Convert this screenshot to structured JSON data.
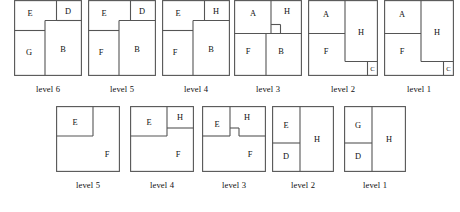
{
  "figure": {
    "name": "floorplan-level-sequence-figure",
    "stroke_color": "#555555",
    "label_color": "#111111",
    "background": "#ffffff",
    "rows": [
      {
        "id": "top",
        "diagrams": [
          {
            "caption": "level 6",
            "regions": [
              {
                "label": "E",
                "lx": 16,
                "ly": 16
              },
              {
                "label": "D",
                "lx": 52,
                "ly": 16
              },
              {
                "label": "G",
                "lx": 14,
                "ly": 52
              },
              {
                "label": "B",
                "lx": 46,
                "ly": 50
              }
            ]
          },
          {
            "caption": "level 5",
            "regions": [
              {
                "label": "E",
                "lx": 16,
                "ly": 16
              },
              {
                "label": "D",
                "lx": 52,
                "ly": 16
              },
              {
                "label": "F",
                "lx": 13,
                "ly": 52
              },
              {
                "label": "B",
                "lx": 46,
                "ly": 50
              }
            ]
          },
          {
            "caption": "level 4",
            "regions": [
              {
                "label": "E",
                "lx": 16,
                "ly": 16
              },
              {
                "label": "H",
                "lx": 52,
                "ly": 16
              },
              {
                "label": "F",
                "lx": 13,
                "ly": 52
              },
              {
                "label": "B",
                "lx": 46,
                "ly": 50
              }
            ]
          },
          {
            "caption": "level 3",
            "regions": [
              {
                "label": "A",
                "lx": 18,
                "ly": 16
              },
              {
                "label": "H",
                "lx": 52,
                "ly": 14
              },
              {
                "label": "F",
                "lx": 13,
                "ly": 50
              },
              {
                "label": "B",
                "lx": 44,
                "ly": 50
              }
            ]
          },
          {
            "caption": "level 2",
            "regions": [
              {
                "label": "A",
                "lx": 17,
                "ly": 17
              },
              {
                "label": "H",
                "lx": 49,
                "ly": 33
              },
              {
                "label": "F",
                "lx": 17,
                "ly": 52
              },
              {
                "label": "C",
                "lx": 62,
                "ly": 64
              }
            ]
          },
          {
            "caption": "level 1",
            "regions": [
              {
                "label": "A",
                "lx": 17,
                "ly": 17
              },
              {
                "label": "H",
                "lx": 49,
                "ly": 33
              },
              {
                "label": "F",
                "lx": 17,
                "ly": 52
              },
              {
                "label": "C",
                "lx": 62,
                "ly": 64
              }
            ]
          }
        ]
      },
      {
        "id": "bottom",
        "diagrams": [
          {
            "caption": "level 5",
            "regions": [
              {
                "label": "E",
                "lx": 19,
                "ly": 19
              },
              {
                "label": "F",
                "lx": 52,
                "ly": 48
              }
            ]
          },
          {
            "caption": "level 4",
            "regions": [
              {
                "label": "E",
                "lx": 18,
                "ly": 19
              },
              {
                "label": "H",
                "lx": 51,
                "ly": 15
              },
              {
                "label": "F",
                "lx": 49,
                "ly": 49
              }
            ]
          },
          {
            "caption": "level 3",
            "regions": [
              {
                "label": "E",
                "lx": 15,
                "ly": 21
              },
              {
                "label": "H",
                "lx": 47,
                "ly": 15
              },
              {
                "label": "F",
                "lx": 51,
                "ly": 51
              }
            ]
          },
          {
            "caption": "level 2",
            "regions": [
              {
                "label": "E",
                "lx": 14,
                "ly": 19
              },
              {
                "label": "D",
                "lx": 14,
                "ly": 51
              },
              {
                "label": "H",
                "lx": 47,
                "ly": 33
              }
            ]
          },
          {
            "caption": "level 1",
            "regions": [
              {
                "label": "G",
                "lx": 14,
                "ly": 19
              },
              {
                "label": "D",
                "lx": 14,
                "ly": 51
              },
              {
                "label": "H",
                "lx": 47,
                "ly": 33
              }
            ]
          }
        ]
      }
    ]
  }
}
